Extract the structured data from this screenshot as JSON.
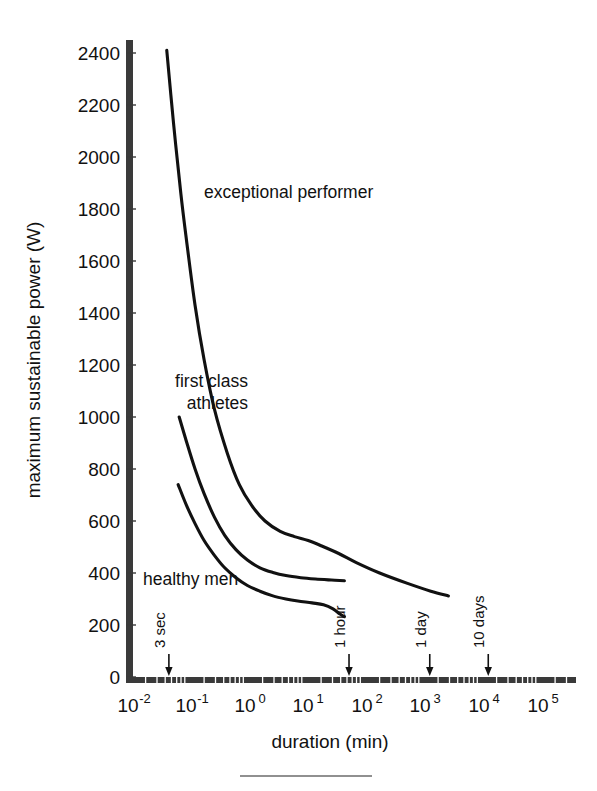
{
  "chart_data": {
    "type": "line",
    "title": "",
    "xlabel": "duration (min)",
    "ylabel": "maximum sustainable power (W)",
    "xscale": "log",
    "yscale": "linear",
    "xlim": [
      0.01,
      100000
    ],
    "ylim": [
      0,
      2500
    ],
    "grid": false,
    "legend": "inline-curve-labels",
    "x_tick_labels": [
      {
        "base": "10",
        "exp": "-2",
        "value": 0.01
      },
      {
        "base": "10",
        "exp": "-1",
        "value": 0.1
      },
      {
        "base": "10",
        "exp": "0",
        "value": 1
      },
      {
        "base": "10",
        "exp": "1",
        "value": 10
      },
      {
        "base": "10",
        "exp": "2",
        "value": 100
      },
      {
        "base": "10",
        "exp": "3",
        "value": 1000
      },
      {
        "base": "10",
        "exp": "4",
        "value": 10000
      },
      {
        "base": "10",
        "exp": "5",
        "value": 100000
      }
    ],
    "y_tick_labels": [
      "0",
      "200",
      "400",
      "600",
      "800",
      "1000",
      "1200",
      "1400",
      "1600",
      "1800",
      "2000",
      "2200",
      "2400"
    ],
    "y_tick_values": [
      0,
      200,
      400,
      600,
      800,
      1000,
      1200,
      1400,
      1600,
      1800,
      2000,
      2200,
      2400
    ],
    "series": [
      {
        "name": "exceptional performer",
        "label": "exceptional performer",
        "color": "#111111",
        "points": [
          [
            0.046,
            2410
          ],
          [
            0.06,
            2130
          ],
          [
            0.08,
            1860
          ],
          [
            0.1,
            1680
          ],
          [
            0.14,
            1430
          ],
          [
            0.2,
            1220
          ],
          [
            0.3,
            1030
          ],
          [
            0.5,
            860
          ],
          [
            0.8,
            740
          ],
          [
            1.3,
            660
          ],
          [
            2.2,
            600
          ],
          [
            4.0,
            560
          ],
          [
            7.0,
            540
          ],
          [
            12,
            525
          ],
          [
            20,
            505
          ],
          [
            40,
            475
          ],
          [
            80,
            440
          ],
          [
            200,
            400
          ],
          [
            600,
            360
          ],
          [
            1500,
            330
          ],
          [
            3000,
            312
          ]
        ]
      },
      {
        "name": "first class athletes",
        "label": "first class athletes",
        "color": "#111111",
        "points": [
          [
            0.075,
            1000
          ],
          [
            0.1,
            905
          ],
          [
            0.14,
            800
          ],
          [
            0.2,
            705
          ],
          [
            0.3,
            615
          ],
          [
            0.45,
            545
          ],
          [
            0.7,
            490
          ],
          [
            1.1,
            450
          ],
          [
            1.8,
            420
          ],
          [
            3.0,
            402
          ],
          [
            5.0,
            390
          ],
          [
            9.0,
            382
          ],
          [
            16,
            377
          ],
          [
            30,
            373
          ],
          [
            50,
            370
          ]
        ]
      },
      {
        "name": "healthy men",
        "label": "healthy men",
        "color": "#111111",
        "points": [
          [
            0.072,
            740
          ],
          [
            0.1,
            660
          ],
          [
            0.14,
            590
          ],
          [
            0.2,
            525
          ],
          [
            0.3,
            468
          ],
          [
            0.45,
            420
          ],
          [
            0.7,
            382
          ],
          [
            1.1,
            352
          ],
          [
            1.8,
            330
          ],
          [
            3.0,
            312
          ],
          [
            5.0,
            300
          ],
          [
            8.0,
            292
          ],
          [
            14,
            285
          ],
          [
            22,
            278
          ],
          [
            32,
            262
          ],
          [
            42,
            242
          ],
          [
            50,
            232
          ]
        ]
      }
    ],
    "annotations": [
      {
        "label": "3 sec",
        "x_value": 0.05,
        "orientation": "vertical",
        "arrow": "down"
      },
      {
        "label": "1 hour",
        "x_value": 60,
        "orientation": "vertical",
        "arrow": "down"
      },
      {
        "label": "1 day",
        "x_value": 1440,
        "orientation": "vertical",
        "arrow": "down"
      },
      {
        "label": "10 days",
        "x_value": 14400,
        "orientation": "vertical",
        "arrow": "down"
      }
    ],
    "curve_label_positions": [
      {
        "name": "exceptional performer",
        "lines": [
          "exceptional performer"
        ],
        "align": "start"
      },
      {
        "name": "first class athletes",
        "lines": [
          "first class",
          "athletes"
        ],
        "align": "end"
      },
      {
        "name": "healthy men",
        "lines": [
          "healthy men"
        ],
        "align": "start"
      }
    ]
  },
  "axes": {
    "x_title": "duration (min)",
    "y_title": "maximum sustainable power (W)"
  },
  "labels": {
    "exceptional_performer": "exceptional performer",
    "first_class_line1": "first class",
    "first_class_line2": "athletes",
    "healthy_men": "healthy men",
    "three_sec": "3 sec",
    "one_hour": "1 hour",
    "one_day": "1 day",
    "ten_days": "10 days"
  },
  "y_ticks": {
    "t0": "0",
    "t200": "200",
    "t400": "400",
    "t600": "600",
    "t800": "800",
    "t1000": "1000",
    "t1200": "1200",
    "t1400": "1400",
    "t1600": "1600",
    "t1800": "1800",
    "t2000": "2000",
    "t2200": "2200",
    "t2400": "2400"
  },
  "x_ticks": {
    "base": "10",
    "e_m2": "-2",
    "e_m1": "-1",
    "e_0": "0",
    "e_1": "1",
    "e_2": "2",
    "e_3": "3",
    "e_4": "4",
    "e_5": "5"
  },
  "colors": {
    "curve": "#111111",
    "axis": "#3a3a3a",
    "background": "#ffffff",
    "footer_rule": "#6b6b6b"
  }
}
